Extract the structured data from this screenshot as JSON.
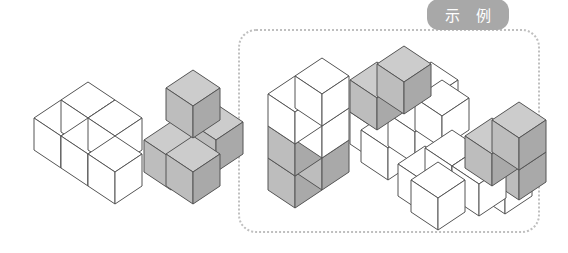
{
  "page": {
    "background_color": "#ffffff"
  },
  "example_panel": {
    "tab_label": "示 例",
    "tab_bg_color": "#a8a8a8",
    "tab_text_color": "#ffffff",
    "border_color": "#bfbfbf",
    "border_style": "dotted",
    "border_radius_px": 18
  },
  "palette": {
    "outline": "#555555",
    "white_top": "#ffffff",
    "white_left": "#ffffff",
    "white_right": "#ffffff",
    "gray_top": "#cccccc",
    "gray_left": "#bdbdbd",
    "gray_right": "#a9a9a9"
  },
  "figures": [
    {
      "id": "figure-1",
      "name": "white-row-block",
      "location": "left-outside-example",
      "cube_count": 4,
      "color": "white",
      "description": "Row of three white cubes with one white cube behind at left"
    },
    {
      "id": "figure-2",
      "name": "gray-l-block",
      "location": "left-outside-example",
      "cube_count": 4,
      "color": "gray",
      "description": "Gray L shaped block with one cube stacked on top rear"
    },
    {
      "id": "figure-3",
      "name": "tall-white-gray-tower",
      "location": "inside-example",
      "cube_count": 6,
      "color": "mixed",
      "description": "Two white cubes on top of gray cubes forming a tall tower"
    },
    {
      "id": "figure-4",
      "name": "white-base-gray-top",
      "location": "inside-example",
      "cube_count": 6,
      "color": "mixed",
      "description": "White base layer with two gray cubes stacked on the rear"
    },
    {
      "id": "figure-5",
      "name": "white-row-gray-pair",
      "location": "inside-example",
      "cube_count": 7,
      "color": "mixed",
      "description": "White cubes in a row with two gray cubes stacked at the right rear"
    }
  ]
}
